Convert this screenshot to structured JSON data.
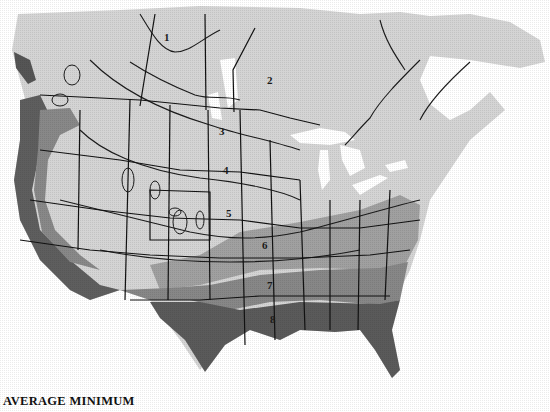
{
  "map": {
    "title": "AVERAGE MINIMUM",
    "subject": "Plant hardiness zones of North America (average minimum temperature)",
    "zones": [
      {
        "id": "1",
        "label": "1",
        "shade": "#d9d9d9",
        "x": 164,
        "y": 37
      },
      {
        "id": "2",
        "label": "2",
        "shade": "#dcdcdc",
        "x": 267,
        "y": 80
      },
      {
        "id": "3",
        "label": "3",
        "shade": "#d3d3d3",
        "x": 219,
        "y": 131
      },
      {
        "id": "4",
        "label": "4",
        "shade": "#cfcfcf",
        "x": 223,
        "y": 170
      },
      {
        "id": "5",
        "label": "5",
        "shade": "#c8c8c8",
        "x": 226,
        "y": 213
      },
      {
        "id": "6",
        "label": "6",
        "shade": "#9a9a9a",
        "x": 262,
        "y": 245
      },
      {
        "id": "7",
        "label": "7",
        "shade": "#8a8a8a",
        "x": 267,
        "y": 285
      },
      {
        "id": "8",
        "label": "8",
        "shade": "#5c5c5c",
        "x": 270,
        "y": 319
      }
    ],
    "colors": {
      "background": "#ffffff",
      "zone_light": "#d6d6d6",
      "zone_mid_light": "#bcbcbc",
      "zone_mid": "#9a9a9a",
      "zone_dark": "#6b6b6b",
      "zone_darkest": "#4a4a4a",
      "lines": "#1a1a1a"
    }
  }
}
